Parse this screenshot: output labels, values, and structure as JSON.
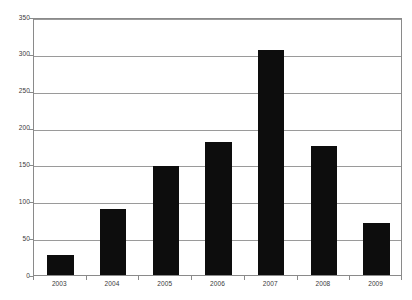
{
  "chart_data": {
    "type": "bar",
    "title": "",
    "subtitle": "",
    "xlabel": "",
    "ylabel": "",
    "categories": [
      "2003",
      "2004",
      "2005",
      "2006",
      "2007",
      "2008",
      "2009"
    ],
    "values": [
      27,
      90,
      148,
      180,
      305,
      175,
      70
    ],
    "series": [
      {
        "name": "",
        "values": [
          27,
          90,
          148,
          180,
          305,
          175,
          70
        ]
      }
    ],
    "ylim": [
      0,
      350
    ],
    "yticks": [
      0,
      50,
      100,
      150,
      200,
      250,
      300,
      350
    ],
    "ytick_labels": [
      "0",
      "50",
      "100",
      "150",
      "200",
      "250",
      "300",
      "350"
    ],
    "grid": true,
    "grid_axis": "y",
    "legend": false,
    "legend_position": "none",
    "annotations": [],
    "bar_color": "#0d0d0d",
    "grid_color": "#9a9a9a",
    "frame_color": "#8a8a8a",
    "background_color": "#ffffff",
    "tick_label_color": "#3a3a3a"
  }
}
